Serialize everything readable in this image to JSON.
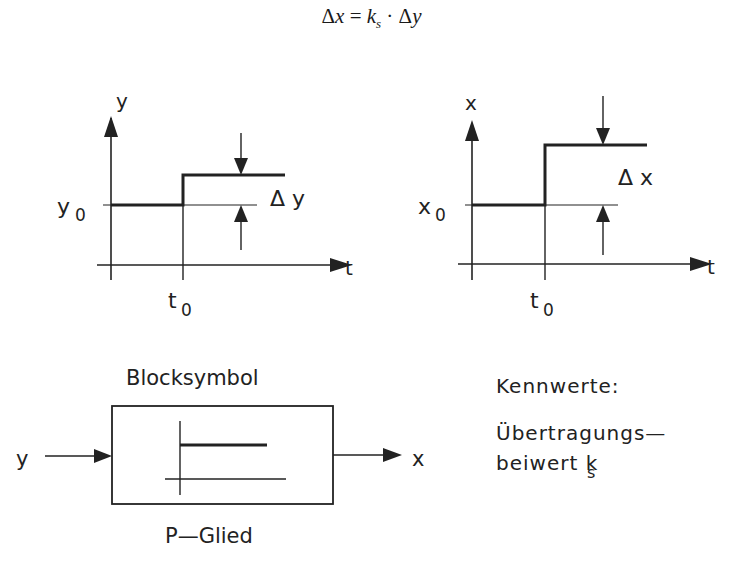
{
  "formula": {
    "lhs_delta": "Δ",
    "lhs_var": "x",
    "equals": " = ",
    "coef": "k",
    "coef_sub": "s",
    "dot": " · ",
    "rhs_delta": "Δ",
    "rhs_var": "y"
  },
  "input_plot": {
    "y_axis_label": "y",
    "t_axis_label": "t",
    "level_label": "y",
    "level_sub": "0",
    "step_time_label": "t",
    "step_time_sub": "0",
    "delta_label": "Δ y"
  },
  "output_plot": {
    "y_axis_label": "x",
    "t_axis_label": "t",
    "level_label": "x",
    "level_sub": "0",
    "step_time_label": "t",
    "step_time_sub": "0",
    "delta_label": "Δ x"
  },
  "block": {
    "title": "Blocksymbol",
    "caption": "P—Glied",
    "input_label": "y",
    "output_label": "x"
  },
  "parameters": {
    "heading": "Kennwerte:",
    "line1": "Übertragungs—",
    "line2": "beiwert k",
    "line2_sub": "s"
  },
  "colors": {
    "stroke": "#222222",
    "background": "#ffffff"
  }
}
